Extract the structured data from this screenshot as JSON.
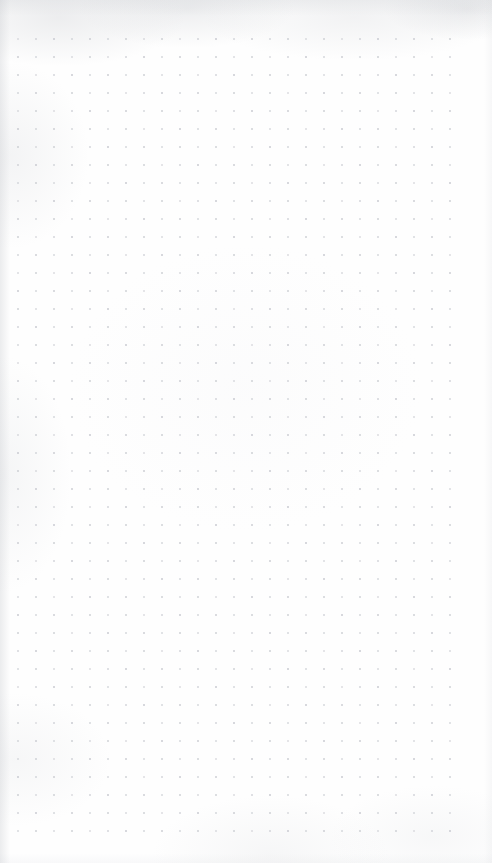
{
  "document": {
    "type": "dot-grid-paper",
    "title": "Blank dot grid page",
    "page_width": 492,
    "page_height": 863,
    "content_text": "",
    "annotations": [],
    "paper_color": "#fefefe",
    "dot_color": "#c8cad0",
    "edge_shadow_color": "#c0c3c8"
  },
  "grid": {
    "name": "dot-matrix",
    "spacing_px": 18,
    "dot_size_px": 2,
    "origin_x": 17,
    "origin_y": 38,
    "columns": 25,
    "rows": 45,
    "total_dots": 1125,
    "margin_left_px": 17,
    "margin_top_px": 38,
    "margin_right_px": 29,
    "margin_bottom_px": 29
  }
}
